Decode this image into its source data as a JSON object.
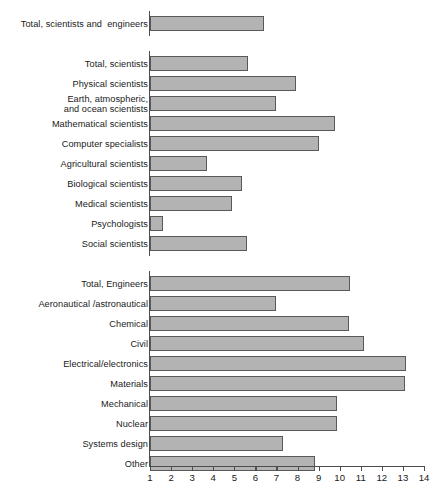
{
  "chart_data": {
    "type": "bar",
    "orientation": "horizontal",
    "title": "",
    "subtitle": "",
    "xlabel": "",
    "ylabel": "",
    "xlim": [
      1,
      14
    ],
    "grid": false,
    "legend": null,
    "xticks": [
      "1",
      "2",
      "3",
      "4",
      "5",
      "6",
      "7",
      "8",
      "9",
      "10",
      "11",
      "12",
      "13",
      "14"
    ],
    "bar_color": "#b3b3b3",
    "bar_edge_color": "#595959",
    "axis_color": "#4d4d4d",
    "categories": [
      "Total, scientists and  engineers",
      "Total, scientists",
      "Physical scientists",
      "Earth, atmospheric,\nand ocean scientists",
      "Mathematical scientists",
      "Computer specialists",
      "Agricultural scientists",
      "Biological scientists",
      "Medical scientists",
      "Psychologists",
      "Social scientists",
      "Total, Engineers",
      "Aeronautical /astronautical",
      "Chemical",
      "Civil",
      "Electrical/electronics",
      "Materials",
      "Mechanical",
      "Nuclear",
      "Systems design",
      "Other"
    ],
    "values": [
      6.4,
      5.65,
      7.95,
      7.0,
      9.8,
      9.0,
      3.7,
      5.35,
      4.9,
      1.6,
      5.6,
      10.5,
      7.0,
      10.45,
      11.15,
      13.15,
      13.1,
      9.85,
      9.85,
      7.3,
      8.85
    ]
  }
}
